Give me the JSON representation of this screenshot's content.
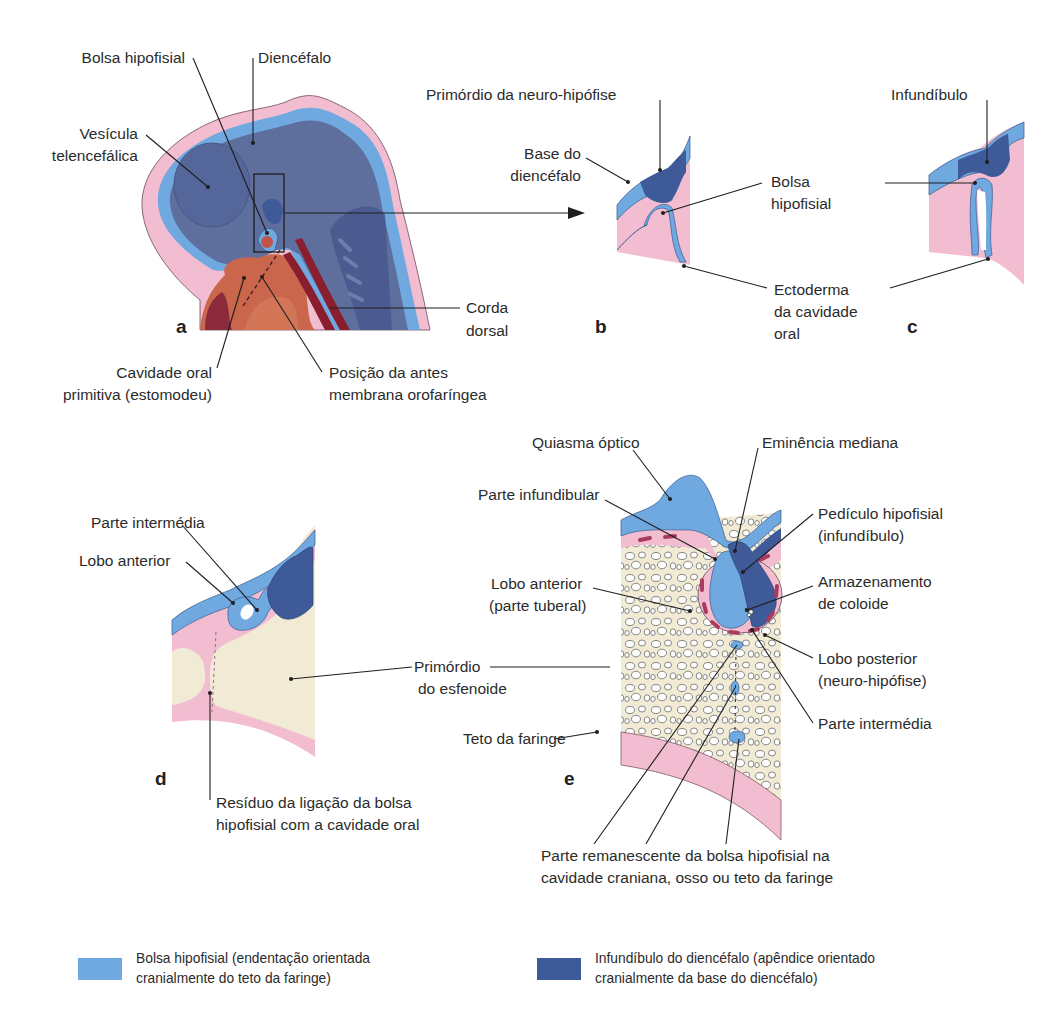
{
  "colors": {
    "bolsa_hipofisial": "#6fa9e0",
    "infundibulo": "#3e5a98",
    "diencefalo": "#5e6f9e",
    "ectoderm_pink": "#f3bdd1",
    "bone_cream": "#f1ebd6",
    "oral_brown": "#c9664c",
    "dark_red": "#8a1e2e"
  },
  "panels": {
    "a": {
      "letter": "a",
      "labels": {
        "bolsa_hipofisial": "Bolsa hipofisial",
        "diencefalo": "Diencéfalo",
        "vesicula_l1": "Vesícula",
        "vesicula_l2": "telencefálica",
        "corda_l1": "Corda",
        "corda_l2": "dorsal",
        "cavidade_l1": "Cavidade oral",
        "cavidade_l2": "primitiva (estomodeu)",
        "posicao_l1": "Posição da antes",
        "posicao_l2": "membrana orofaríngea"
      }
    },
    "b": {
      "letter": "b",
      "labels": {
        "primordio": "Primórdio da neuro-hipófise",
        "base_l1": "Base do",
        "base_l2": "diencéfalo",
        "bolsa_l1": "Bolsa",
        "bolsa_l2": "hipofisial",
        "ecto_l1": "Ectoderma",
        "ecto_l2": "da cavidade",
        "ecto_l3": "oral"
      }
    },
    "c": {
      "letter": "c",
      "labels": {
        "infundibulo": "Infundíbulo"
      }
    },
    "d": {
      "letter": "d",
      "labels": {
        "parte_intermedia": "Parte intermédia",
        "lobo_anterior": "Lobo anterior",
        "primordio_l1": "Primórdio",
        "primordio_l2": "do esfenoide",
        "residuo_l1": "Resíduo da ligação da bolsa",
        "residuo_l2": "hipofisial com a cavidade oral"
      }
    },
    "e": {
      "letter": "e",
      "labels": {
        "quiasma": "Quiasma óptico",
        "eminencia": "Eminência mediana",
        "parte_infundibular": "Parte infundibular",
        "pediculo_l1": "Pedículo hipofisial",
        "pediculo_l2": "(infundíbulo)",
        "lobo_anterior_l1": "Lobo anterior",
        "lobo_anterior_l2": "(parte tuberal)",
        "armazenamento_l1": "Armazenamento",
        "armazenamento_l2": "de coloide",
        "lobo_posterior_l1": "Lobo posterior",
        "lobo_posterior_l2": "(neuro-hipófise)",
        "parte_intermedia": "Parte intermédia",
        "teto_faringe": "Teto da faringe",
        "remanescente_l1": "Parte remanescente da bolsa hipofisial na",
        "remanescente_l2": "cavidade craniana, osso ou teto da faringe"
      }
    }
  },
  "legend": [
    {
      "color": "#6fa9e0",
      "line1": "Bolsa hipofisial (endentação orientada",
      "line2": "cranialmente do teto da faringe)"
    },
    {
      "color": "#3e5a98",
      "line1": "Infundíbulo do diencéfalo (apêndice orientado",
      "line2": "cranialmente da base do diencéfalo)"
    }
  ]
}
